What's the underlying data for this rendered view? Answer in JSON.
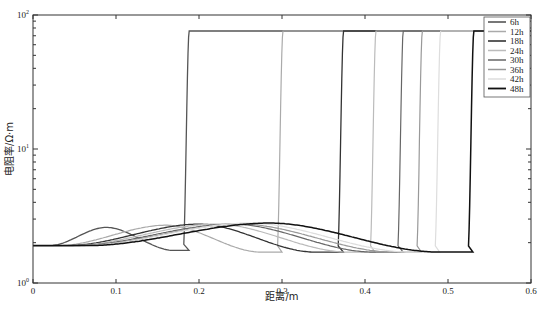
{
  "chart_data": {
    "type": "line",
    "title": "",
    "xlabel": "距离/m",
    "ylabel": "电阻率/Ω·m",
    "xlim": [
      0,
      0.6
    ],
    "ylim": [
      1,
      100
    ],
    "yscale": "log",
    "grid": false,
    "legend_position": "upper right",
    "x_ticks": [
      "0",
      "0.1",
      "0.2",
      "0.3",
      "0.4",
      "0.5",
      "0.6"
    ],
    "y_ticks": [
      "10^0",
      "10^1",
      "10^2"
    ],
    "baseline_value": 1.9,
    "plateau_value": 76,
    "series": [
      {
        "name": "6h",
        "color": "#555555",
        "width": 1.3,
        "jump_x": 0.187,
        "bump_peak_x": 0.088,
        "bump_peak": 2.6,
        "dip_x": 0.17,
        "dip_min": 1.75,
        "rise_start": 0.02
      },
      {
        "name": "12h",
        "color": "#aaaaaa",
        "width": 1.2,
        "jump_x": 0.3,
        "bump_peak_x": 0.16,
        "bump_peak": 2.7,
        "dip_x": 0.275,
        "dip_min": 1.7,
        "rise_start": 0.03
      },
      {
        "name": "18h",
        "color": "#333333",
        "width": 1.3,
        "jump_x": 0.373,
        "bump_peak_x": 0.2,
        "bump_peak": 2.75,
        "dip_x": 0.34,
        "dip_min": 1.7,
        "rise_start": 0.04
      },
      {
        "name": "24h",
        "color": "#bbbbbb",
        "width": 1.2,
        "jump_x": 0.412,
        "bump_peak_x": 0.22,
        "bump_peak": 2.75,
        "dip_x": 0.38,
        "dip_min": 1.7,
        "rise_start": 0.045
      },
      {
        "name": "30h",
        "color": "#666666",
        "width": 1.2,
        "jump_x": 0.445,
        "bump_peak_x": 0.24,
        "bump_peak": 2.75,
        "dip_x": 0.41,
        "dip_min": 1.7,
        "rise_start": 0.05
      },
      {
        "name": "36h",
        "color": "#999999",
        "width": 1.2,
        "jump_x": 0.468,
        "bump_peak_x": 0.25,
        "bump_peak": 2.75,
        "dip_x": 0.435,
        "dip_min": 1.7,
        "rise_start": 0.055
      },
      {
        "name": "42h",
        "color": "#dddddd",
        "width": 1.2,
        "jump_x": 0.49,
        "bump_peak_x": 0.26,
        "bump_peak": 2.8,
        "dip_x": 0.455,
        "dip_min": 1.7,
        "rise_start": 0.06
      },
      {
        "name": "48h",
        "color": "#111111",
        "width": 1.5,
        "jump_x": 0.53,
        "bump_peak_x": 0.285,
        "bump_peak": 2.8,
        "dip_x": 0.49,
        "dip_min": 1.7,
        "rise_start": 0.065
      }
    ]
  }
}
